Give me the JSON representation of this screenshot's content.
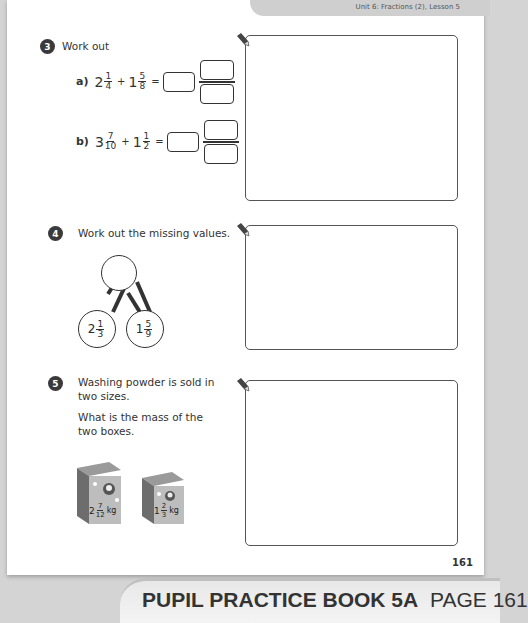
{
  "header": {
    "unit_lesson": "Unit 6: Fractions (2), Lesson 5"
  },
  "questions": [
    {
      "number": "3",
      "prompt": "Work out",
      "parts": [
        {
          "label": "a)",
          "whole1": "2",
          "num1": "1",
          "den1": "4",
          "operator": "+",
          "whole2": "1",
          "num2": "5",
          "den2": "8",
          "equals": "="
        },
        {
          "label": "b)",
          "whole1": "3",
          "num1": "7",
          "den1": "10",
          "operator": "+",
          "whole2": "1",
          "num2": "1",
          "den2": "2",
          "equals": "="
        }
      ]
    },
    {
      "number": "4",
      "prompt": "Work out the missing values.",
      "part_whole": {
        "whole": "",
        "part1": {
          "whole": "2",
          "num": "1",
          "den": "3"
        },
        "part2": {
          "whole": "1",
          "num": "5",
          "den": "9"
        }
      }
    },
    {
      "number": "5",
      "prompt_line1": "Washing powder is sold in",
      "prompt_line2": "two sizes.",
      "question_line1": "What is the mass of the",
      "question_line2": "two boxes.",
      "boxes": [
        {
          "whole": "2",
          "num": "7",
          "den": "12",
          "unit": "kg"
        },
        {
          "whole": "1",
          "num": "2",
          "den": "3",
          "unit": "kg"
        }
      ]
    }
  ],
  "footer": {
    "page_number": "161",
    "banner_bold": "PUPIL PRACTICE BOOK 5A",
    "banner_regular": "PAGE 161"
  }
}
